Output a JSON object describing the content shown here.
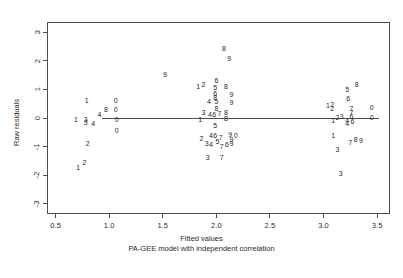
{
  "chart_data": {
    "type": "scatter",
    "title": "",
    "xlabel": "Fitted values",
    "sublabel": "PA-GEE model with independent correlation",
    "ylabel": "Raw residuals",
    "xlim": [
      0.42,
      3.62
    ],
    "ylim": [
      -3.35,
      3.35
    ],
    "xticks": [
      "0.5",
      "1.0",
      "1.5",
      "2.0",
      "2.5",
      "3.0",
      "3.5"
    ],
    "xtick_values": [
      0.5,
      1.0,
      1.5,
      2.0,
      2.5,
      3.0,
      3.5
    ],
    "yticks": [
      "3",
      "2",
      "1",
      "0",
      "-1",
      "-2",
      "-3"
    ],
    "ytick_values": [
      3,
      2,
      1,
      0,
      -1,
      -2,
      -3
    ],
    "grid": false,
    "legend": false,
    "marker_style": "digit-glyph",
    "reference_line": {
      "type": "horizontal",
      "y": 0,
      "x_start": 0.93,
      "x_end": 3.52
    },
    "points": [
      {
        "label": "1",
        "x": 0.79,
        "y": 0.62
      },
      {
        "label": "0",
        "x": 1.06,
        "y": 0.62
      },
      {
        "label": "8",
        "x": 0.97,
        "y": 0.33
      },
      {
        "label": "0",
        "x": 1.06,
        "y": 0.33
      },
      {
        "label": "4",
        "x": 0.91,
        "y": 0.13
      },
      {
        "label": "1",
        "x": 0.69,
        "y": -0.04
      },
      {
        "label": "3",
        "x": 0.78,
        "y": -0.02
      },
      {
        "label": "0",
        "x": 1.07,
        "y": -0.02
      },
      {
        "label": "3",
        "x": 0.78,
        "y": -0.15
      },
      {
        "label": "4",
        "x": 0.85,
        "y": -0.16
      },
      {
        "label": "0",
        "x": 1.07,
        "y": -0.43
      },
      {
        "label": "2",
        "x": 0.8,
        "y": -0.88
      },
      {
        "label": "2",
        "x": 0.77,
        "y": -1.53
      },
      {
        "label": "1",
        "x": 0.71,
        "y": -1.7
      },
      {
        "label": "9",
        "x": 1.52,
        "y": 1.52
      },
      {
        "label": "8",
        "x": 2.07,
        "y": 2.45
      },
      {
        "label": "9",
        "x": 2.12,
        "y": 2.1
      },
      {
        "label": "6",
        "x": 2.0,
        "y": 1.33
      },
      {
        "label": "1",
        "x": 1.83,
        "y": 1.13
      },
      {
        "label": "2",
        "x": 1.88,
        "y": 1.18
      },
      {
        "label": "5",
        "x": 1.99,
        "y": 1.08
      },
      {
        "label": "8",
        "x": 2.09,
        "y": 1.1
      },
      {
        "label": "6",
        "x": 1.99,
        "y": 0.86
      },
      {
        "label": "9",
        "x": 2.14,
        "y": 0.85
      },
      {
        "label": "8",
        "x": 1.99,
        "y": 0.75
      },
      {
        "label": "4",
        "x": 1.93,
        "y": 0.6
      },
      {
        "label": "5",
        "x": 2.0,
        "y": 0.59
      },
      {
        "label": "9",
        "x": 2.14,
        "y": 0.56
      },
      {
        "label": "8",
        "x": 2.0,
        "y": 0.34
      },
      {
        "label": "3",
        "x": 1.88,
        "y": 0.2
      },
      {
        "label": "4",
        "x": 1.94,
        "y": 0.14
      },
      {
        "label": "6",
        "x": 1.98,
        "y": 0.14
      },
      {
        "label": "7",
        "x": 2.03,
        "y": 0.16
      },
      {
        "label": "8",
        "x": 2.09,
        "y": 0.22
      },
      {
        "label": "8",
        "x": 2.09,
        "y": 0.0
      },
      {
        "label": "1",
        "x": 1.85,
        "y": -0.03
      },
      {
        "label": "5",
        "x": 1.99,
        "y": -0.25
      },
      {
        "label": "2",
        "x": 1.86,
        "y": -0.69
      },
      {
        "label": "4",
        "x": 1.95,
        "y": -0.6
      },
      {
        "label": "6",
        "x": 1.99,
        "y": -0.6
      },
      {
        "label": "7",
        "x": 2.04,
        "y": -0.66
      },
      {
        "label": "9",
        "x": 2.13,
        "y": -0.56
      },
      {
        "label": "0",
        "x": 2.18,
        "y": -0.6
      },
      {
        "label": "9",
        "x": 2.14,
        "y": -0.74
      },
      {
        "label": "3",
        "x": 1.91,
        "y": -0.86
      },
      {
        "label": "4",
        "x": 1.95,
        "y": -0.9
      },
      {
        "label": "5",
        "x": 2.01,
        "y": -0.81
      },
      {
        "label": "7",
        "x": 2.05,
        "y": -0.97
      },
      {
        "label": "6",
        "x": 2.1,
        "y": -0.9
      },
      {
        "label": "9",
        "x": 2.14,
        "y": -0.87
      },
      {
        "label": "3",
        "x": 1.92,
        "y": -1.35
      },
      {
        "label": "7",
        "x": 2.05,
        "y": -1.36
      },
      {
        "label": "8",
        "x": 3.31,
        "y": 1.17
      },
      {
        "label": "5",
        "x": 3.22,
        "y": 1.0
      },
      {
        "label": "6",
        "x": 3.23,
        "y": 0.7
      },
      {
        "label": "1",
        "x": 3.04,
        "y": 0.47
      },
      {
        "label": "2",
        "x": 3.08,
        "y": 0.5
      },
      {
        "label": "2",
        "x": 3.08,
        "y": 0.36
      },
      {
        "label": "7",
        "x": 3.26,
        "y": 0.34
      },
      {
        "label": "0",
        "x": 3.45,
        "y": 0.38
      },
      {
        "label": "7",
        "x": 3.26,
        "y": 0.22
      },
      {
        "label": "2",
        "x": 3.13,
        "y": 0.05
      },
      {
        "label": "3",
        "x": 3.17,
        "y": 0.07
      },
      {
        "label": "6",
        "x": 3.26,
        "y": 0.06
      },
      {
        "label": "0",
        "x": 3.45,
        "y": 0.02
      },
      {
        "label": "1",
        "x": 3.09,
        "y": -0.07
      },
      {
        "label": "4",
        "x": 3.22,
        "y": -0.08
      },
      {
        "label": "6",
        "x": 3.27,
        "y": -0.1
      },
      {
        "label": "4",
        "x": 3.22,
        "y": -0.18
      },
      {
        "label": "1",
        "x": 3.09,
        "y": -0.6
      },
      {
        "label": "8",
        "x": 3.3,
        "y": -0.72
      },
      {
        "label": "9",
        "x": 3.35,
        "y": -0.78
      },
      {
        "label": "7",
        "x": 3.25,
        "y": -0.85
      },
      {
        "label": "3",
        "x": 3.13,
        "y": -1.09
      },
      {
        "label": "3",
        "x": 3.16,
        "y": -1.93
      }
    ]
  }
}
